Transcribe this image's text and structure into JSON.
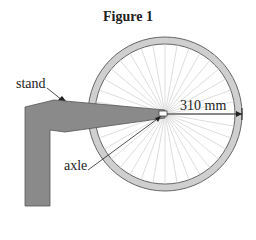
{
  "figure": {
    "title": "Figure 1",
    "labels": {
      "stand": "stand",
      "axle": "axle",
      "radius": "310 mm"
    },
    "colors": {
      "stand_fill": "#8a8a8a",
      "rim_fill": "#cfcfcf",
      "spokes": "#cccccc",
      "outline": "#444444"
    },
    "wheel": {
      "spoke_count": 36,
      "radius_mm": 310
    }
  }
}
